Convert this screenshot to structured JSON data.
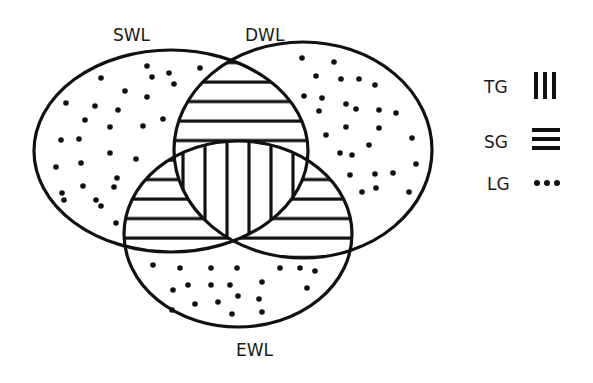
{
  "diagram": {
    "type": "venn-3",
    "colors": {
      "ink": "#111111",
      "background": "#ffffff"
    },
    "sets": [
      {
        "id": "SWL",
        "label": "SWL",
        "cx": 171,
        "cy": 151,
        "rx": 137,
        "ry": 101,
        "label_x": 113,
        "label_y": 41
      },
      {
        "id": "DWL",
        "label": "DWL",
        "cx": 303,
        "cy": 150,
        "rx": 129,
        "ry": 108,
        "label_x": 245,
        "label_y": 41
      },
      {
        "id": "EWL",
        "label": "EWL",
        "cx": 238,
        "cy": 234,
        "rx": 114,
        "ry": 93,
        "label_x": 236,
        "label_y": 356
      }
    ],
    "regions": [
      {
        "sets": [
          "SWL"
        ],
        "pattern": "dots",
        "class": "LG"
      },
      {
        "sets": [
          "DWL"
        ],
        "pattern": "dots",
        "class": "LG"
      },
      {
        "sets": [
          "EWL"
        ],
        "pattern": "dots",
        "class": "LG"
      },
      {
        "sets": [
          "SWL",
          "DWL"
        ],
        "pattern": "horizontal-lines",
        "class": "SG"
      },
      {
        "sets": [
          "SWL",
          "EWL"
        ],
        "pattern": "horizontal-lines",
        "class": "SG"
      },
      {
        "sets": [
          "DWL",
          "EWL"
        ],
        "pattern": "horizontal-lines",
        "class": "SG"
      },
      {
        "sets": [
          "SWL",
          "DWL",
          "EWL"
        ],
        "pattern": "vertical-lines",
        "class": "TG"
      }
    ],
    "dots": {
      "SWL_only": [
        [
          147,
          66
        ],
        [
          101,
          78
        ],
        [
          152,
          77
        ],
        [
          169,
          73
        ],
        [
          174,
          84
        ],
        [
          200,
          68
        ],
        [
          125,
          91
        ],
        [
          147,
          97
        ],
        [
          66,
          103
        ],
        [
          95,
          106
        ],
        [
          118,
          110
        ],
        [
          85,
          120
        ],
        [
          110,
          127
        ],
        [
          143,
          126
        ],
        [
          163,
          119
        ],
        [
          61,
          140
        ],
        [
          79,
          139
        ],
        [
          110,
          153
        ],
        [
          136,
          159
        ],
        [
          56,
          167
        ],
        [
          81,
          163
        ],
        [
          62,
          193
        ],
        [
          83,
          186
        ],
        [
          114,
          187
        ],
        [
          117,
          178
        ],
        [
          64,
          200
        ],
        [
          96,
          200
        ],
        [
          101,
          206
        ],
        [
          116,
          223
        ]
      ],
      "DWL_only": [
        [
          302,
          58
        ],
        [
          334,
          62
        ],
        [
          316,
          76
        ],
        [
          341,
          79
        ],
        [
          359,
          79
        ],
        [
          375,
          85
        ],
        [
          304,
          96
        ],
        [
          322,
          98
        ],
        [
          319,
          111
        ],
        [
          346,
          104
        ],
        [
          356,
          109
        ],
        [
          379,
          110
        ],
        [
          396,
          113
        ],
        [
          346,
          127
        ],
        [
          379,
          128
        ],
        [
          326,
          135
        ],
        [
          412,
          138
        ],
        [
          369,
          145
        ],
        [
          340,
          153
        ],
        [
          352,
          155
        ],
        [
          416,
          164
        ],
        [
          350,
          175
        ],
        [
          375,
          174
        ],
        [
          393,
          173
        ],
        [
          362,
          192
        ],
        [
          409,
          192
        ],
        [
          376,
          188
        ]
      ],
      "EWL_only": [
        [
          153,
          265
        ],
        [
          180,
          268
        ],
        [
          211,
          268
        ],
        [
          237,
          268
        ],
        [
          280,
          268
        ],
        [
          173,
          290
        ],
        [
          188,
          285
        ],
        [
          211,
          285
        ],
        [
          230,
          285
        ],
        [
          262,
          282
        ],
        [
          238,
          296
        ],
        [
          195,
          304
        ],
        [
          218,
          302
        ],
        [
          232,
          314
        ],
        [
          259,
          299
        ],
        [
          262,
          312
        ],
        [
          172,
          310
        ],
        [
          300,
          268
        ],
        [
          315,
          271
        ],
        [
          307,
          288
        ]
      ]
    }
  },
  "legend": {
    "items": [
      {
        "label": "TG",
        "symbol": "vertical-lines",
        "meaning_pattern": "triple overlap"
      },
      {
        "label": "SG",
        "symbol": "horizontal-lines",
        "meaning_pattern": "double overlap"
      },
      {
        "label": "LG",
        "symbol": "dots",
        "meaning_pattern": "single set"
      }
    ]
  }
}
